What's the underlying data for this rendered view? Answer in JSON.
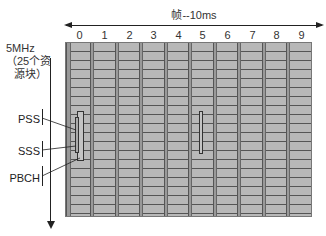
{
  "diagram": {
    "frame_label": "帧--10ms",
    "subframes": [
      "0",
      "1",
      "2",
      "3",
      "4",
      "5",
      "6",
      "7",
      "8",
      "9"
    ],
    "bandwidth_label_line1": "5MHz",
    "bandwidth_label_line2": "（25个资",
    "bandwidth_label_line3": "源块）",
    "signals": {
      "pss": "PSS",
      "sss": "SSS",
      "pbch": "PBCH"
    },
    "colors": {
      "grid_fill": "#b8b8b8",
      "grid_lines": "#555555",
      "separator": "#999999",
      "axis": "#222222"
    }
  }
}
